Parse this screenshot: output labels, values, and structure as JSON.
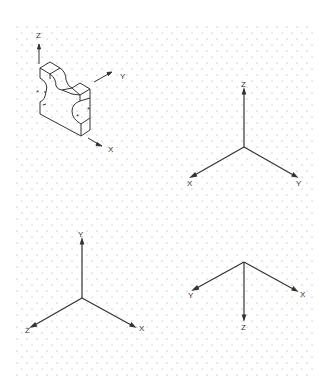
{
  "figure": {
    "grid": {
      "type": "isometric-dot",
      "color": "#9a9a9a",
      "x_start": 17,
      "x_end": 312,
      "y_start": 27,
      "y_end": 378,
      "dx": 10,
      "dy": 6
    },
    "object": {
      "description": "isometric block with semicircular notches",
      "markers": [
        "*",
        "*",
        "*"
      ],
      "axes": {
        "z": "Z",
        "y": "Y",
        "x": "X"
      }
    },
    "triads": [
      {
        "id": "top-right",
        "labels": {
          "up": "Z",
          "left": "X",
          "right": "Y"
        }
      },
      {
        "id": "bottom-left",
        "labels": {
          "up": "Y",
          "left": "Z",
          "right": "X"
        }
      },
      {
        "id": "bottom-right",
        "labels": {
          "down": "Z",
          "left": "Y",
          "right": "X"
        }
      }
    ],
    "line_color": "#333333"
  }
}
